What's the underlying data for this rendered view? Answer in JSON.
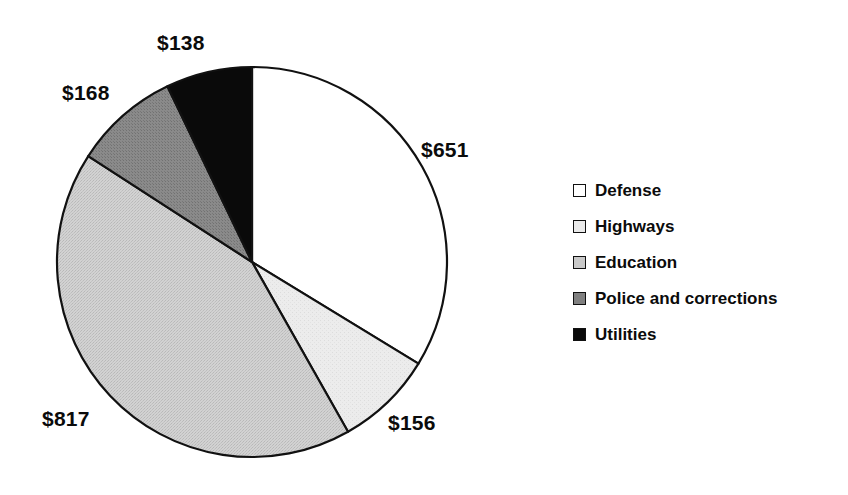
{
  "chart_data": {
    "type": "pie",
    "title": "",
    "subtitle": "",
    "xlabel": "",
    "ylabel": "",
    "grid": false,
    "legend_position": "right",
    "value_prefix": "$",
    "total": 1930,
    "start_angle_deg": 0,
    "direction": "clockwise",
    "categories": [
      "Defense",
      "Highways",
      "Education",
      "Police and corrections",
      "Utilities"
    ],
    "values": [
      651,
      156,
      817,
      168,
      138
    ],
    "data_labels": [
      "$651",
      "$156",
      "$817",
      "$168",
      "$138"
    ],
    "slices": [
      {
        "name": "Defense",
        "value": 651,
        "label": "$651",
        "color": "#ffffff",
        "edge_color": "#111111",
        "percent": 33.7,
        "start_deg": 0.0,
        "end_deg": 121.4,
        "label_x": 421,
        "label_y": 139
      },
      {
        "name": "Highways",
        "value": 156,
        "label": "$156",
        "color": "#e9e9e9",
        "edge_color": "#111111",
        "percent": 8.1,
        "start_deg": 121.4,
        "end_deg": 150.5,
        "label_x": 388,
        "label_y": 412
      },
      {
        "name": "Education",
        "value": 817,
        "label": "$817",
        "color": "#c9c9c9",
        "edge_color": "#111111",
        "percent": 42.3,
        "start_deg": 150.5,
        "end_deg": 302.9,
        "label_x": 42,
        "label_y": 408
      },
      {
        "name": "Police and corrections",
        "value": 168,
        "label": "$168",
        "color": "#808080",
        "edge_color": "#111111",
        "percent": 8.7,
        "start_deg": 302.9,
        "end_deg": 334.3,
        "label_x": 62,
        "label_y": 82
      },
      {
        "name": "Utilities",
        "value": 138,
        "label": "$138",
        "color": "#0a0a0a",
        "edge_color": "#111111",
        "percent": 7.2,
        "start_deg": 334.3,
        "end_deg": 360.0,
        "label_x": 157,
        "label_y": 32
      }
    ],
    "geometry": {
      "center_x": 252,
      "center_y": 262,
      "radius": 195
    }
  },
  "legend": {
    "items": [
      {
        "label": "Defense",
        "swatch_color": "#ffffff"
      },
      {
        "label": "Highways",
        "swatch_color": "#e9e9e9"
      },
      {
        "label": "Education",
        "swatch_color": "#c9c9c9"
      },
      {
        "label": "Police and corrections",
        "swatch_color": "#808080"
      },
      {
        "label": "Utilities",
        "swatch_color": "#0a0a0a"
      }
    ]
  }
}
